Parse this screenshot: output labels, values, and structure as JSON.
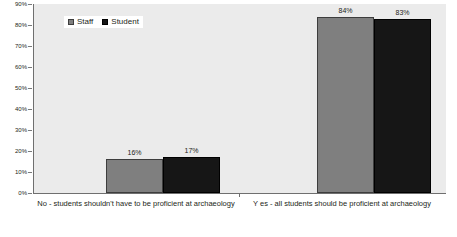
{
  "chart_data": {
    "type": "bar",
    "title": "",
    "subtitle": "",
    "xlabel": "",
    "ylabel": "",
    "categories": [
      "No - students shouldn't have to be proficient at archaeology",
      "Y es - all students should be proficient at archaeology"
    ],
    "series": [
      {
        "name": "Staff",
        "values": [
          16,
          84
        ],
        "labels": [
          "16%",
          "84%"
        ],
        "color": "#7f7f7f"
      },
      {
        "name": "Student",
        "values": [
          17,
          83
        ],
        "labels": [
          "17%",
          "83%"
        ],
        "color": "#161616"
      }
    ],
    "ylim": [
      0,
      90
    ],
    "ytick_values": [
      0,
      10,
      20,
      30,
      40,
      50,
      60,
      70,
      80,
      90
    ],
    "ytick_labels": [
      "0%",
      "10%",
      "20%",
      "30%",
      "40%",
      "50%",
      "60%",
      "70%",
      "80%",
      "90%"
    ],
    "grid": false,
    "legend_position": "top-left-inside",
    "value_labels_shown": true,
    "plot_background": "#ebebeb",
    "page_background": "#ffffff",
    "axis_color": "#6f6f6f",
    "text_color": "#231f20"
  },
  "legend": {
    "items": [
      {
        "label": "Staff"
      },
      {
        "label": "Student"
      }
    ]
  }
}
